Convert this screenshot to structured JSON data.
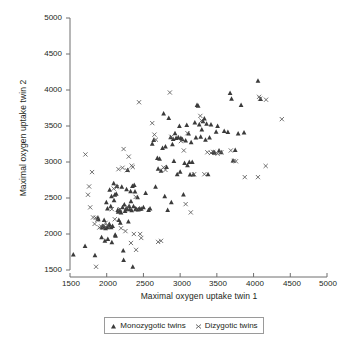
{
  "chart_data": {
    "type": "scatter",
    "title": "",
    "xlabel": "Maximal oxygen uptake twin 1",
    "ylabel": "Maximal oxygen uptake twin 2",
    "xlim": [
      1500,
      5000
    ],
    "ylim": [
      1500,
      5000
    ],
    "xticks": [
      1500,
      2000,
      2500,
      3000,
      3500,
      4000,
      4500,
      5000
    ],
    "yticks": [
      1500,
      2000,
      2500,
      3000,
      3500,
      4000,
      4500,
      5000
    ],
    "grid": false,
    "legend_position": "bottom-center",
    "series": [
      {
        "name": "Monozygotic twins",
        "marker": "triangle",
        "color": "#3b3b3b",
        "points": [
          [
            1545,
            1715
          ],
          [
            1705,
            1835
          ],
          [
            1840,
            1705
          ],
          [
            1880,
            2225
          ],
          [
            1885,
            2205
          ],
          [
            1930,
            1955
          ],
          [
            1935,
            2090
          ],
          [
            1945,
            2110
          ],
          [
            1960,
            2105
          ],
          [
            1965,
            2195
          ],
          [
            1975,
            1905
          ],
          [
            1985,
            2080
          ],
          [
            1995,
            2440
          ],
          [
            2005,
            2095
          ],
          [
            2010,
            2355
          ],
          [
            2015,
            1930
          ],
          [
            2025,
            2115
          ],
          [
            2035,
            2140
          ],
          [
            2040,
            2615
          ],
          [
            2055,
            2385
          ],
          [
            2060,
            2095
          ],
          [
            2065,
            2525
          ],
          [
            2070,
            1885
          ],
          [
            2080,
            2110
          ],
          [
            2095,
            2705
          ],
          [
            2100,
            2470
          ],
          [
            2110,
            2545
          ],
          [
            2115,
            1990
          ],
          [
            2120,
            1975
          ],
          [
            2130,
            2560
          ],
          [
            2140,
            2665
          ],
          [
            2150,
            2335
          ],
          [
            2155,
            2310
          ],
          [
            2165,
            2195
          ],
          [
            2175,
            2330
          ],
          [
            2185,
            2155
          ],
          [
            2195,
            2300
          ],
          [
            2205,
            2655
          ],
          [
            2215,
            2370
          ],
          [
            2225,
            1770
          ],
          [
            2230,
            1640
          ],
          [
            2240,
            2410
          ],
          [
            2250,
            2320
          ],
          [
            2260,
            2345
          ],
          [
            2270,
            2620
          ],
          [
            2275,
            2355
          ],
          [
            2285,
            2890
          ],
          [
            2295,
            2175
          ],
          [
            2305,
            2390
          ],
          [
            2315,
            2345
          ],
          [
            2325,
            2595
          ],
          [
            2330,
            2455
          ],
          [
            2340,
            2330
          ],
          [
            2350,
            2665
          ],
          [
            2355,
            1545
          ],
          [
            2365,
            2385
          ],
          [
            2375,
            2680
          ],
          [
            2385,
            2590
          ],
          [
            2395,
            2350
          ],
          [
            2400,
            2345
          ],
          [
            2420,
            2510
          ],
          [
            2430,
            2340
          ],
          [
            2450,
            2350
          ],
          [
            2470,
            2350
          ],
          [
            2500,
            2370
          ],
          [
            2530,
            2570
          ],
          [
            2570,
            2335
          ],
          [
            2590,
            2355
          ],
          [
            2620,
            3255
          ],
          [
            2640,
            3305
          ],
          [
            2665,
            2655
          ],
          [
            2690,
            3055
          ],
          [
            2700,
            2905
          ],
          [
            2720,
            3045
          ],
          [
            2740,
            2880
          ],
          [
            2760,
            3195
          ],
          [
            2775,
            3675
          ],
          [
            2790,
            2525
          ],
          [
            2800,
            3215
          ],
          [
            2815,
            2930
          ],
          [
            2830,
            2335
          ],
          [
            2845,
            3610
          ],
          [
            2870,
            3345
          ],
          [
            2880,
            2440
          ],
          [
            2895,
            3245
          ],
          [
            2905,
            3320
          ],
          [
            2915,
            3015
          ],
          [
            2930,
            3400
          ],
          [
            2945,
            3335
          ],
          [
            2960,
            2830
          ],
          [
            2975,
            3345
          ],
          [
            2990,
            3500
          ],
          [
            3000,
            2865
          ],
          [
            3010,
            3335
          ],
          [
            3030,
            3315
          ],
          [
            3045,
            2550
          ],
          [
            3060,
            2985
          ],
          [
            3075,
            3300
          ],
          [
            3090,
            3515
          ],
          [
            3100,
            2955
          ],
          [
            3115,
            3395
          ],
          [
            3125,
            3000
          ],
          [
            3135,
            2825
          ],
          [
            3150,
            3275
          ],
          [
            3165,
            3000
          ],
          [
            3180,
            2825
          ],
          [
            3200,
            3550
          ],
          [
            3215,
            3340
          ],
          [
            3230,
            3790
          ],
          [
            3245,
            3780
          ],
          [
            3260,
            3520
          ],
          [
            3280,
            3350
          ],
          [
            3295,
            3450
          ],
          [
            3310,
            3565
          ],
          [
            3330,
            3605
          ],
          [
            3345,
            3310
          ],
          [
            3360,
            3530
          ],
          [
            3380,
            2830
          ],
          [
            3400,
            3340
          ],
          [
            3420,
            3520
          ],
          [
            3450,
            3140
          ],
          [
            3470,
            3130
          ],
          [
            3490,
            3420
          ],
          [
            3510,
            3500
          ],
          [
            3530,
            3160
          ],
          [
            3560,
            3135
          ],
          [
            3600,
            3430
          ],
          [
            3650,
            3415
          ],
          [
            3680,
            3960
          ],
          [
            3700,
            3880
          ],
          [
            3720,
            3020
          ],
          [
            3750,
            3165
          ],
          [
            3790,
            3395
          ],
          [
            3830,
            3790
          ],
          [
            3870,
            3410
          ],
          [
            4060,
            4130
          ],
          [
            4095,
            3875
          ]
        ]
      },
      {
        "name": "Dizygotic twins",
        "marker": "cross",
        "color": "#5a5a5a",
        "points": [
          [
            1710,
            3105
          ],
          [
            1745,
            2545
          ],
          [
            1760,
            2660
          ],
          [
            1775,
            2370
          ],
          [
            1800,
            2860
          ],
          [
            1815,
            2230
          ],
          [
            1835,
            2140
          ],
          [
            1850,
            2225
          ],
          [
            1855,
            1545
          ],
          [
            1870,
            2200
          ],
          [
            1900,
            2090
          ],
          [
            1925,
            2105
          ],
          [
            1960,
            2110
          ],
          [
            1985,
            2155
          ],
          [
            2010,
            2115
          ],
          [
            2070,
            2345
          ],
          [
            2095,
            2630
          ],
          [
            2110,
            2205
          ],
          [
            2135,
            2650
          ],
          [
            2160,
            2900
          ],
          [
            2180,
            2345
          ],
          [
            2195,
            2080
          ],
          [
            2215,
            2920
          ],
          [
            2230,
            3180
          ],
          [
            2255,
            2040
          ],
          [
            2275,
            2885
          ],
          [
            2290,
            2370
          ],
          [
            2300,
            3075
          ],
          [
            2330,
            1875
          ],
          [
            2340,
            2950
          ],
          [
            2355,
            2930
          ],
          [
            2370,
            2000
          ],
          [
            2395,
            2515
          ],
          [
            2400,
            1780
          ],
          [
            2420,
            2355
          ],
          [
            2440,
            3830
          ],
          [
            2455,
            2000
          ],
          [
            2470,
            1945
          ],
          [
            2620,
            3540
          ],
          [
            2650,
            3380
          ],
          [
            2670,
            3310
          ],
          [
            2700,
            1890
          ],
          [
            2740,
            1905
          ],
          [
            2775,
            2925
          ],
          [
            2800,
            2890
          ],
          [
            2860,
            3965
          ],
          [
            2880,
            3350
          ],
          [
            3010,
            3290
          ],
          [
            3050,
            3160
          ],
          [
            3075,
            2415
          ],
          [
            3100,
            3400
          ],
          [
            3145,
            2300
          ],
          [
            3190,
            2830
          ],
          [
            3275,
            3640
          ],
          [
            3290,
            3575
          ],
          [
            3330,
            2830
          ],
          [
            3370,
            3135
          ],
          [
            3420,
            3125
          ],
          [
            3450,
            3140
          ],
          [
            3510,
            3115
          ],
          [
            3560,
            3135
          ],
          [
            3690,
            3160
          ],
          [
            3730,
            3015
          ],
          [
            3760,
            3010
          ],
          [
            3880,
            2790
          ],
          [
            4060,
            2790
          ],
          [
            4075,
            3905
          ],
          [
            4090,
            3880
          ],
          [
            4165,
            2945
          ],
          [
            4170,
            3865
          ],
          [
            4385,
            3595
          ]
        ]
      }
    ]
  },
  "legend": {
    "entries": [
      {
        "label": "Monozygotic twins",
        "marker": "triangle"
      },
      {
        "label": "Dizygotic twins",
        "marker": "cross"
      }
    ]
  },
  "axes": {
    "x_label": "Maximal oxygen uptake twin 1",
    "y_label": "Maximal oxygen uptake twin 2",
    "x_tick_labels": [
      "1500",
      "2000",
      "2500",
      "3000",
      "3500",
      "4000",
      "4500",
      "5000"
    ],
    "y_tick_labels": [
      "5000",
      "4500",
      "4000",
      "3500",
      "3000",
      "2500",
      "2000",
      "1500"
    ]
  },
  "colors": {
    "axis": "#6e6e6e",
    "text": "#231f20",
    "mono_marker": "#3b3b3b",
    "di_marker": "#5a5a5a",
    "legend_border": "#9a9a9a"
  }
}
